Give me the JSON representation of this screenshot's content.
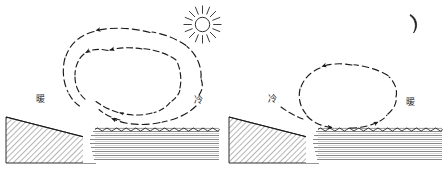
{
  "figure": {
    "title": "",
    "background_color": "#ffffff",
    "ink_color": "#1a1a1a",
    "width": 445,
    "height": 171
  },
  "panels": [
    {
      "id": "left",
      "name": "sea-breeze-daytime",
      "sky_symbol": "sun-icon",
      "sky_symbol_label": "sun",
      "labels": {
        "land_side": "暖",
        "sea_side": "冷"
      },
      "circulation": {
        "loops": 2,
        "direction": "counterclockwise",
        "top_flow": "leftward",
        "bottom_flow": "leftward",
        "line_style": "dashed"
      },
      "terrain": {
        "land": "hatched-slope",
        "sea": "horizontal-lined-water",
        "sea_surface": "wavy"
      }
    },
    {
      "id": "right",
      "name": "land-breeze-nighttime",
      "sky_symbol": "crescent-moon-icon",
      "sky_symbol_label": "moon",
      "labels": {
        "land_side": "冷",
        "sea_side": "暖"
      },
      "circulation": {
        "loops": 1,
        "direction": "clockwise",
        "top_flow": "leftward",
        "bottom_flow": "rightward",
        "line_style": "dashed"
      },
      "terrain": {
        "land": "hatched-slope",
        "sea": "horizontal-lined-water",
        "sea_surface": "wavy"
      }
    }
  ]
}
